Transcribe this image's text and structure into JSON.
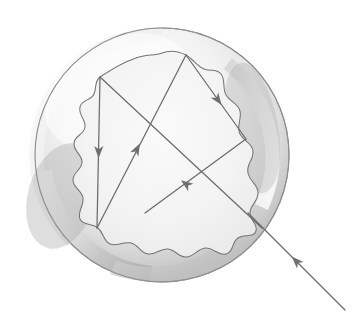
{
  "figure": {
    "title": "Light ray reflections inside a circular particle",
    "background_color": "#ffffff",
    "stroke_color": "#5a5a5a",
    "ray_color": "#6b6b6b",
    "arrow_fill": "#6f6f6f",
    "outer_circle": {
      "name": "outer-boundary-circle",
      "center_x": 162,
      "center_y": 155,
      "radius": 127,
      "outline_color": "#8a8a8a",
      "fill_light": "#fbfbfb",
      "fill_mid": "#e0e0e0",
      "fill_dark": "#b9b9b9"
    },
    "inner_region": {
      "name": "inner-wavy-core",
      "fill_color": "#f4f4f4",
      "outline_color": "#707070"
    },
    "rays": [
      {
        "id": "incoming-ray",
        "label": "incident ray",
        "from_x": 345,
        "from_y": 310,
        "to_x": 248,
        "to_y": 213,
        "arrow_at": 0.58,
        "direction": "up-left"
      },
      {
        "id": "long-diagonal-ray",
        "label": "first internal chord",
        "from_x": 262,
        "from_y": 228,
        "to_x": 100,
        "to_y": 77,
        "arrow_at": 0.0,
        "direction": "up-left"
      },
      {
        "id": "vertical-ray",
        "label": "left vertical reflection",
        "from_x": 100,
        "from_y": 77,
        "to_x": 97,
        "to_y": 228,
        "arrow_at": 0.52,
        "direction": "down"
      },
      {
        "id": "up-right-ray",
        "label": "upward return reflection",
        "from_x": 97,
        "from_y": 228,
        "to_x": 186,
        "to_y": 55,
        "arrow_at": 0.52,
        "direction": "up-right"
      },
      {
        "id": "down-right-ray",
        "label": "descending reflection",
        "from_x": 186,
        "from_y": 55,
        "to_x": 246,
        "to_y": 139,
        "arrow_at": 0.52,
        "direction": "down-right"
      },
      {
        "id": "exit-ray",
        "label": "transmitted segment",
        "from_x": 246,
        "from_y": 139,
        "to_x": 145,
        "to_y": 213,
        "arrow_at": 0.6,
        "direction": "down-left"
      }
    ],
    "arrow_count": 5,
    "vertices": [
      {
        "name": "vertex-top",
        "x": 186,
        "y": 55
      },
      {
        "name": "vertex-upper-left",
        "x": 100,
        "y": 77
      },
      {
        "name": "vertex-bottom-left",
        "x": 97,
        "y": 228
      },
      {
        "name": "vertex-right",
        "x": 246,
        "y": 139
      },
      {
        "name": "ray-endpoint-center",
        "x": 145,
        "y": 213
      }
    ]
  }
}
